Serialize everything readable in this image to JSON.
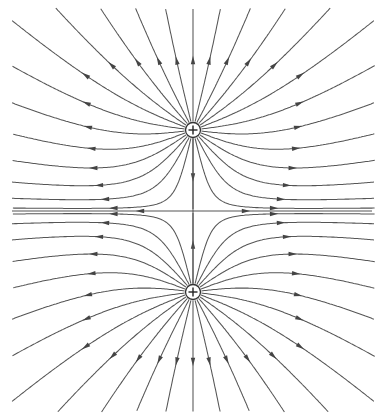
{
  "diagram": {
    "title": "Electric field lines of two equal positive charges",
    "width": 386,
    "height": 419,
    "line_color": "#555555",
    "charges": [
      {
        "id": "top",
        "sign": "+",
        "x": 193,
        "y": 130,
        "r": 7.5
      },
      {
        "id": "bottom",
        "sign": "+",
        "x": 193,
        "y": 292,
        "r": 7.5
      }
    ],
    "midline": {
      "y": 211,
      "x_start": 12,
      "x_end": 372,
      "arrows": [
        {
          "x": 140,
          "dir": "left"
        },
        {
          "x": 246,
          "dir": "right"
        }
      ]
    },
    "lines_per_charge": 26,
    "bounds": {
      "xmin": 12,
      "xmax": 375,
      "ymin": 8,
      "ymax": 412
    }
  }
}
